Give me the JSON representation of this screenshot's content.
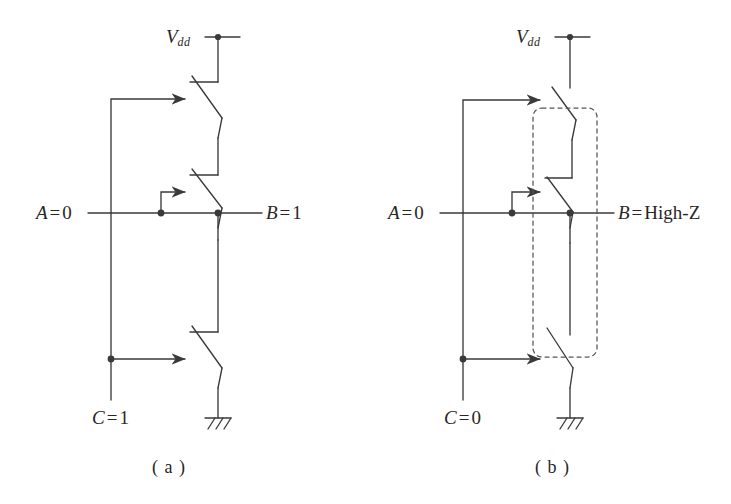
{
  "figure": {
    "type": "switch-level-circuit-diagram",
    "stroke_color": "#3a3a3a",
    "text_color": "#2a2626",
    "dashed_color": "#555555",
    "background": "#ffffff"
  },
  "panels": [
    {
      "id": "a",
      "caption": "( a )",
      "supply_label": {
        "symbol": "V",
        "subscript": "dd"
      },
      "inputs": [
        {
          "name": "A",
          "equals": "=",
          "value": "0",
          "full": "A = 0"
        },
        {
          "name": "C",
          "equals": "=",
          "value": "1",
          "full": "C = 1"
        }
      ],
      "output": {
        "name": "B",
        "equals": "=",
        "value": "1",
        "full": "B = 1"
      },
      "switches": [
        {
          "index": 1,
          "state": "closed",
          "control": "A",
          "position": "top-pmos"
        },
        {
          "index": 2,
          "state": "closed",
          "control": "A",
          "position": "middle"
        },
        {
          "index": 3,
          "state": "closed",
          "control": "C",
          "position": "bottom-nmos"
        }
      ],
      "ground": "hatched-ground",
      "dashed_highlight": false
    },
    {
      "id": "b",
      "caption": "( b )",
      "supply_label": {
        "symbol": "V",
        "subscript": "dd"
      },
      "inputs": [
        {
          "name": "A",
          "equals": "=",
          "value": "0",
          "full": "A = 0"
        },
        {
          "name": "C",
          "equals": "=",
          "value": "0",
          "full": "C = 0"
        }
      ],
      "output": {
        "name": "B",
        "equals": "=",
        "value": "High-Z",
        "full": "B = High-Z"
      },
      "switches": [
        {
          "index": 1,
          "state": "open",
          "control": "A",
          "position": "top-pmos"
        },
        {
          "index": 2,
          "state": "open",
          "control": "A",
          "position": "middle"
        },
        {
          "index": 3,
          "state": "open",
          "control": "C",
          "position": "bottom-nmos"
        }
      ],
      "ground": "hatched-ground",
      "dashed_highlight": true
    }
  ],
  "footer_sliver": ""
}
